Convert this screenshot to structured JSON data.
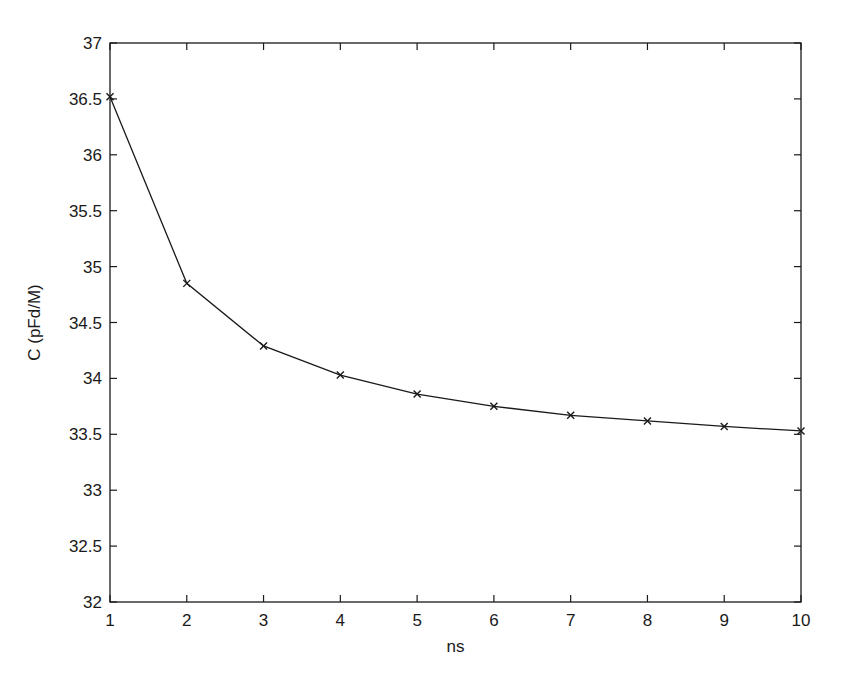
{
  "chart_data": {
    "type": "line",
    "title": "",
    "xlabel": "ns",
    "ylabel": "C (pFd/M)",
    "x": [
      1,
      2,
      3,
      4,
      5,
      6,
      7,
      8,
      9,
      10
    ],
    "series": [
      {
        "name": "C",
        "marker": "x",
        "color": "#1a1a1a",
        "values": [
          36.52,
          34.85,
          34.29,
          34.03,
          33.86,
          33.75,
          33.67,
          33.62,
          33.57,
          33.53
        ]
      }
    ],
    "xlim": [
      1,
      10
    ],
    "ylim": [
      32,
      37
    ],
    "xticks": [
      1,
      2,
      3,
      4,
      5,
      6,
      7,
      8,
      9,
      10
    ],
    "yticks": [
      32,
      32.5,
      33,
      33.5,
      34,
      34.5,
      35,
      35.5,
      36,
      36.5,
      37
    ],
    "xtick_labels": [
      "1",
      "2",
      "3",
      "4",
      "5",
      "6",
      "7",
      "8",
      "9",
      "10"
    ],
    "ytick_labels": [
      "32",
      "32.5",
      "33",
      "33.5",
      "34",
      "34.5",
      "35",
      "35.5",
      "36",
      "36.5",
      "37"
    ],
    "grid": false,
    "legend": null
  },
  "plot_area": {
    "left": 110,
    "top": 43,
    "right": 801,
    "bottom": 602
  },
  "colors": {
    "line": "#1a1a1a",
    "axes": "#1a1a1a",
    "background": "#ffffff"
  }
}
